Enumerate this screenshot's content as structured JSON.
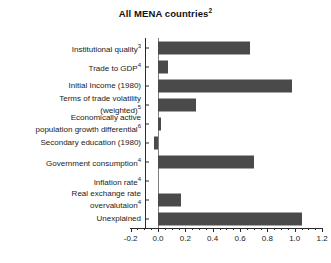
{
  "chart_data": {
    "type": "bar",
    "orientation": "horizontal",
    "title": "All MENA countries",
    "title_superscript": "2",
    "xlabel": "",
    "ylabel": "",
    "xlim": [
      -0.2,
      1.2
    ],
    "grid": false,
    "legend": null,
    "bar_color": "#4a4a4a",
    "xticks": [
      "-0.2",
      "0.0",
      "0.2",
      "0.4",
      "0.6",
      "0.8",
      "1.0",
      "1.2"
    ],
    "xtick_values": [
      -0.2,
      0.0,
      0.2,
      0.4,
      0.6,
      0.8,
      1.0,
      1.2
    ],
    "minor_tick_interval": 0.05,
    "categories": [
      "Institutional quality",
      "Trade to GDP",
      "Initial Income (1980)",
      "Terms of trade volatility\n(weighted)",
      "Economically active\npopulation growth differential",
      "Secondary education (1980)",
      "Government consumption",
      "Inflation rate",
      "Real exchange rate\novervalutaion",
      "Unexplained"
    ],
    "category_superscripts": [
      "3",
      "4",
      "",
      "5",
      "6",
      "",
      "4",
      "4",
      "4",
      ""
    ],
    "values": [
      0.67,
      0.07,
      0.98,
      0.28,
      0.02,
      -0.03,
      0.7,
      0.0,
      0.17,
      1.05
    ]
  }
}
